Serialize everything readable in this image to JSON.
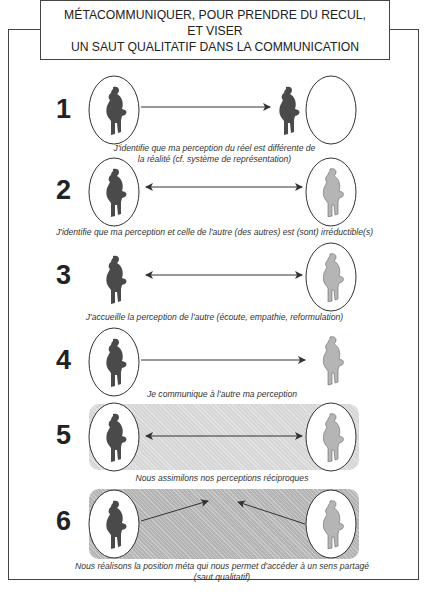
{
  "title": {
    "line1": "MÉTACOMMUNIQUER, POUR PRENDRE DU RECUL,",
    "line2": "ET VISER",
    "line3": "UN SAUT QUALITATIF DANS LA COMMUNICATION"
  },
  "steps": [
    {
      "number": "1",
      "caption_line1": "J'identifie que ma perception du réel est différente de",
      "caption_line2": "la réalité (cf. système de représentation)",
      "arrow": "one-way-right"
    },
    {
      "number": "2",
      "caption_line1": "J'identifie que ma perception et celle de l'autre (des autres) est (sont) irréductible(s)",
      "arrow": "two-way"
    },
    {
      "number": "3",
      "caption_line1": "J'accueille la perception de l'autre (écoute, empathie, reformulation)",
      "arrow": "two-way"
    },
    {
      "number": "4",
      "caption_line1": "Je communique à l'autre ma perception",
      "arrow": "one-way-right"
    },
    {
      "number": "5",
      "caption_line1": "Nous assimilons nos perceptions réciproques",
      "arrow": "two-way"
    },
    {
      "number": "6",
      "caption_line1": "Nous réalisons la position méta qui nous permet d'accéder à un  sens partagé",
      "caption_line2": "(saut qualitatif)",
      "arrow": "converging"
    }
  ],
  "colors": {
    "figure_dark": "#4a4a4a",
    "figure_light": "#b0b0b0",
    "band_light": "#d6d6d6",
    "band_dark": "#b4b4b4",
    "line": "#333333"
  }
}
